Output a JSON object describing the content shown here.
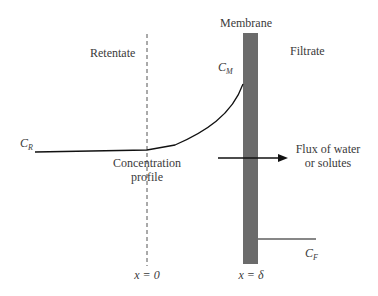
{
  "diagram": {
    "labels": {
      "membrane": "Membrane",
      "retentate": "Retentate",
      "filtrate": "Filtrate",
      "c_m": "C",
      "c_m_sub": "M",
      "c_r": "C",
      "c_r_sub": "R",
      "c_f": "C",
      "c_f_sub": "F",
      "concentration_profile_1": "Concentration",
      "concentration_profile_2": "profile",
      "flux_1": "Flux of water",
      "flux_2": "or solutes",
      "x_zero": "x = 0",
      "x_delta": "x = δ"
    },
    "colors": {
      "membrane": "#6b6b6b",
      "line": "#111111",
      "dashed": "#555555"
    }
  }
}
